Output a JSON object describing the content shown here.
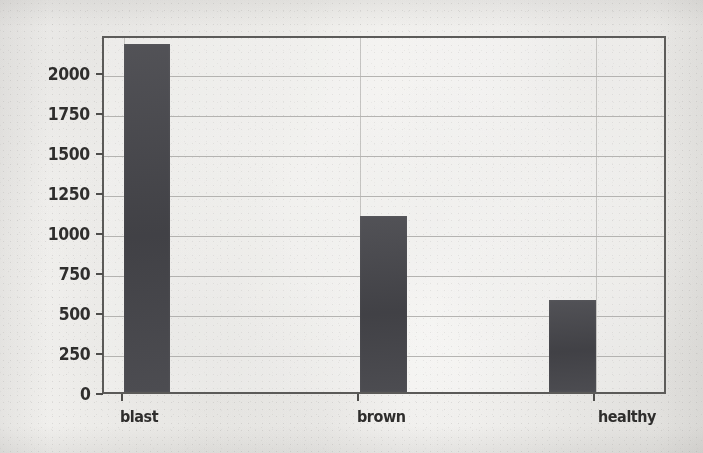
{
  "chart_data": {
    "type": "bar",
    "title": "",
    "subtitle": "",
    "xlabel": "",
    "ylabel": "",
    "categories": [
      "blast",
      "brown",
      "healthy"
    ],
    "values": [
      2175,
      1100,
      575
    ],
    "series": [
      {
        "name": "count",
        "values": [
          2175,
          1100,
          575
        ]
      }
    ],
    "ylim": [
      0,
      2237
    ],
    "xlim": [
      0,
      3
    ],
    "yticks": [
      0,
      250,
      500,
      750,
      1000,
      1250,
      1500,
      1750,
      2000
    ],
    "ytick_labels": [
      "0",
      "250",
      "500",
      "750",
      "1000",
      "1250",
      "1500",
      "1750",
      "2000"
    ],
    "xtick_labels": [
      "blast",
      "brown",
      "healthy"
    ],
    "grid": "horizontal-and-vertical",
    "legend": "none",
    "bar_color": "#45454a",
    "grid_color": "#a9a8a6",
    "axis_color": "#5b5a58",
    "text_color": "#2f2e2d",
    "background_color": "#f3f2f0"
  },
  "axes": {
    "y": {
      "ticks": [
        {
          "label": "2000",
          "value": 2000
        },
        {
          "label": "1750",
          "value": 1750
        },
        {
          "label": "1500",
          "value": 1500
        },
        {
          "label": "1250",
          "value": 1250
        },
        {
          "label": "1000",
          "value": 1000
        },
        {
          "label": "750",
          "value": 750
        },
        {
          "label": "500",
          "value": 500
        },
        {
          "label": "250",
          "value": 250
        },
        {
          "label": "0",
          "value": 0
        }
      ]
    },
    "x": {
      "ticks": [
        {
          "label": "blast",
          "value": 2175
        },
        {
          "label": "brown",
          "value": 1100
        },
        {
          "label": "healthy",
          "value": 575
        }
      ]
    }
  }
}
